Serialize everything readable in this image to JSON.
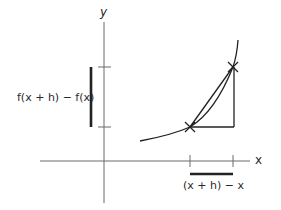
{
  "diagram": {
    "type": "secant-line difference quotient",
    "y_axis_label": "y",
    "x_axis_label": "x",
    "vertical_difference_label": "f(x + h) − f(x)",
    "horizontal_difference_label": "(x + h) − x",
    "points": [
      {
        "name": "(x, f(x))",
        "marker": "cross"
      },
      {
        "name": "(x + h, f(x + h))",
        "marker": "cross"
      }
    ],
    "colors": {
      "axis": "#6b6b6b",
      "curve": "#222222",
      "bar": "#222222"
    }
  }
}
